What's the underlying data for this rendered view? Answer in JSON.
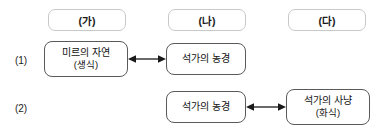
{
  "diagram": {
    "columns": [
      {
        "label": "(가)"
      },
      {
        "label": "(나)"
      },
      {
        "label": "(다)"
      }
    ],
    "rows": [
      {
        "label": "(1)",
        "nodes": [
          {
            "line1": "미르의 자연",
            "line2": "(생식)"
          },
          {
            "line1": "석가의 농경",
            "line2": ""
          }
        ],
        "connector": "double-arrow"
      },
      {
        "label": "(2)",
        "nodes": [
          {
            "line1": "석가의 농경",
            "line2": ""
          },
          {
            "line1": "석가의 사냥",
            "line2": "(화식)"
          }
        ],
        "connector": "double-arrow"
      }
    ],
    "colors": {
      "header_border": "#c9c9c9",
      "node_border": "#5a5a5a",
      "text": "#111111",
      "arrow": "#1a1a1a",
      "background": "#ffffff"
    }
  }
}
